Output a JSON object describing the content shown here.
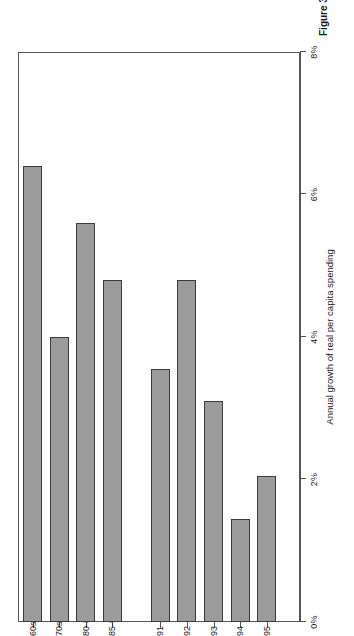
{
  "figure": {
    "caption": "Figure 3.1"
  },
  "chart_data": {
    "type": "bar",
    "orientation": "horizontal",
    "title": "",
    "xlabel": "Annual growth of real per capita spending",
    "ylabel": "Year",
    "categories": [
      "1960s",
      "1970s",
      "1980-85",
      "1985-90",
      "1991",
      "1992",
      "1993",
      "1994",
      "1995"
    ],
    "values": [
      6.4,
      4.0,
      5.6,
      4.8,
      3.55,
      4.8,
      3.1,
      1.45,
      2.05
    ],
    "value_suffix": "%",
    "xlim": [
      0,
      8
    ],
    "xticks": [
      0,
      2,
      4,
      6,
      8
    ],
    "xtick_labels": [
      "0%",
      "2%",
      "4%",
      "6%",
      "8%"
    ],
    "grid": false,
    "legend": "none",
    "bar_fill_color": "#9b9b9b",
    "bar_edge_color": "#3c3c3c",
    "axis_color": "#555555",
    "background_color": "#ffffff"
  }
}
